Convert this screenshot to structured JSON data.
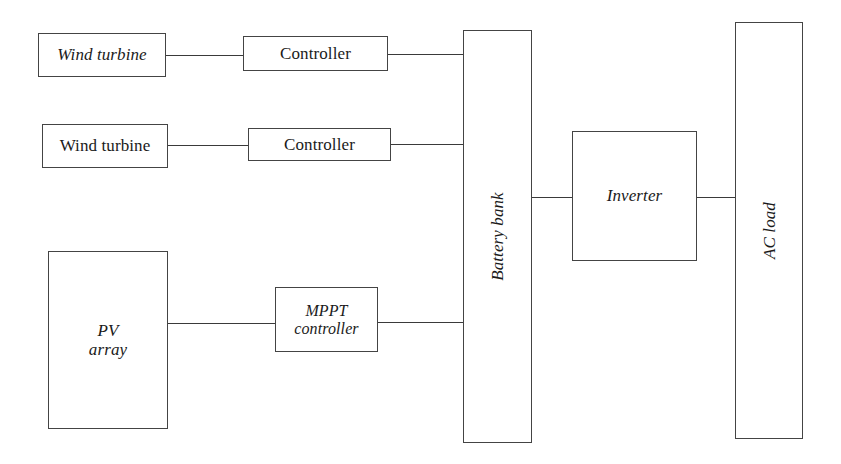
{
  "diagram": {
    "background_color": "#ffffff",
    "line_color": "#3a3a3a",
    "box_border_color": "#444444",
    "text_color": "#1a1a1a",
    "nodes": [
      {
        "id": "wind-turbine-1",
        "label": "Wind turbine",
        "style": "italic"
      },
      {
        "id": "controller-1",
        "label": "Controller",
        "style": "roman"
      },
      {
        "id": "wind-turbine-2",
        "label": "Wind turbine",
        "style": "roman"
      },
      {
        "id": "controller-2",
        "label": "Controller",
        "style": "roman"
      },
      {
        "id": "pv-array",
        "label": "PV\narray",
        "style": "italic"
      },
      {
        "id": "mppt-controller",
        "label": "MPPT\ncontroller",
        "style": "italic"
      },
      {
        "id": "battery-bank",
        "label": "Battery bank",
        "style": "italic-vertical"
      },
      {
        "id": "inverter",
        "label": "Inverter",
        "style": "italic"
      },
      {
        "id": "ac-load",
        "label": "AC load",
        "style": "italic-vertical"
      }
    ],
    "connections": [
      {
        "id": "wt1-ctrl1",
        "from": "wind-turbine-1",
        "to": "controller-1"
      },
      {
        "id": "ctrl1-bat",
        "from": "controller-1",
        "to": "battery-bank"
      },
      {
        "id": "wt2-ctrl2",
        "from": "wind-turbine-2",
        "to": "controller-2"
      },
      {
        "id": "ctrl2-bat",
        "from": "controller-2",
        "to": "battery-bank"
      },
      {
        "id": "pv-mppt",
        "from": "pv-array",
        "to": "mppt-controller"
      },
      {
        "id": "mppt-bat",
        "from": "mppt-controller",
        "to": "battery-bank"
      },
      {
        "id": "bat-inv",
        "from": "battery-bank",
        "to": "inverter"
      },
      {
        "id": "inv-acload",
        "from": "inverter",
        "to": "ac-load"
      }
    ]
  }
}
